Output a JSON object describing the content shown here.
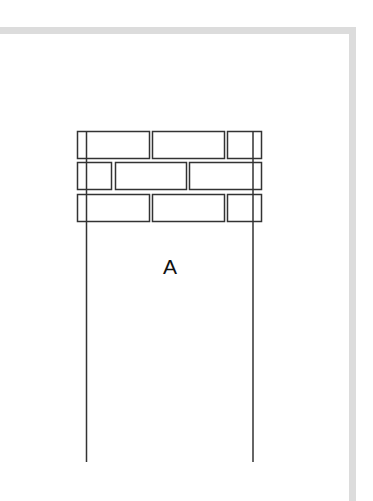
{
  "diagram": {
    "label": "A",
    "colors": {
      "frame": "#dcdcdc",
      "stroke": "#333333",
      "background": "#ffffff"
    },
    "bricks": [
      {
        "row": 1,
        "x": 77,
        "y": 131,
        "w": 72,
        "h": 27
      },
      {
        "row": 1,
        "x": 152,
        "y": 131,
        "w": 72,
        "h": 27
      },
      {
        "row": 1,
        "x": 227,
        "y": 131,
        "w": 34,
        "h": 27
      },
      {
        "row": 2,
        "x": 77,
        "y": 162,
        "w": 34,
        "h": 27
      },
      {
        "row": 2,
        "x": 115,
        "y": 162,
        "w": 71,
        "h": 27
      },
      {
        "row": 2,
        "x": 189,
        "y": 162,
        "w": 72,
        "h": 27
      },
      {
        "row": 3,
        "x": 77,
        "y": 194,
        "w": 72,
        "h": 27
      },
      {
        "row": 3,
        "x": 152,
        "y": 194,
        "w": 72,
        "h": 27
      },
      {
        "row": 3,
        "x": 227,
        "y": 194,
        "w": 34,
        "h": 27
      }
    ],
    "vertical_lines": [
      {
        "x": 86.5,
        "y1": 131,
        "y2": 462
      },
      {
        "x": 253,
        "y1": 131,
        "y2": 462
      }
    ]
  }
}
